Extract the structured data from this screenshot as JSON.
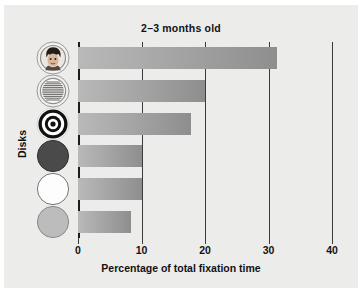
{
  "chart_data": {
    "type": "bar",
    "orientation": "horizontal",
    "title": "2–3 months old",
    "xlabel": "Percentage of total fixation time",
    "ylabel": "Disks",
    "xlim": [
      0,
      40
    ],
    "xticks": [
      "0",
      "10",
      "20",
      "30",
      "40"
    ],
    "xtick_values": [
      0,
      10,
      20,
      30,
      40
    ],
    "grid": true,
    "legend": "none",
    "categories": [
      "face disk",
      "newsprint disk",
      "bullseye disk",
      "red disk",
      "white disk",
      "yellow disk"
    ],
    "values": [
      31.4,
      20.0,
      17.8,
      10.0,
      10.0,
      8.3
    ],
    "series": [
      {
        "name": "Percentage of total fixation time",
        "values": [
          31.4,
          20.0,
          17.8,
          10.0,
          10.0,
          8.3
        ]
      }
    ]
  },
  "figure": {
    "title": "2–3 months old",
    "x_axis_label": "Percentage of total fixation time",
    "y_axis_label": "Disks",
    "background_color": "#ececeb",
    "bar_color": "#a6a6a6",
    "axis_color": "#1d1d1d"
  },
  "ticks": [
    {
      "label": "0",
      "value": 0
    },
    {
      "label": "10",
      "value": 10
    },
    {
      "label": "20",
      "value": 20
    },
    {
      "label": "30",
      "value": 30
    },
    {
      "label": "40",
      "value": 40
    }
  ],
  "disks": [
    {
      "name": "face-disk",
      "icon": "face-disk-icon",
      "value": 31.4
    },
    {
      "name": "newsprint-disk",
      "icon": "newsprint-disk-icon",
      "value": 20.0
    },
    {
      "name": "bullseye-disk",
      "icon": "bullseye-disk-icon",
      "value": 17.8
    },
    {
      "name": "red-disk",
      "icon": "red-disk-icon",
      "value": 10.0
    },
    {
      "name": "white-disk",
      "icon": "white-disk-icon",
      "value": 10.0
    },
    {
      "name": "yellow-disk",
      "icon": "yellow-disk-icon",
      "value": 8.3
    }
  ]
}
